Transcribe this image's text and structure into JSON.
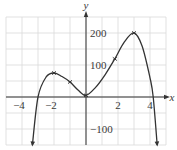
{
  "chart_data": {
    "type": "line",
    "title": "",
    "xlabel": "x",
    "ylabel": "y",
    "xlim": [
      -5,
      5
    ],
    "ylim": [
      -150,
      250
    ],
    "grid": true,
    "x_ticks": [
      -4,
      -2,
      2,
      4
    ],
    "x_tick_labels": [
      "−4",
      "−2",
      "2",
      "4"
    ],
    "y_ticks": [
      200,
      100,
      -100
    ],
    "y_tick_labels": [
      "200",
      "100",
      "−100"
    ],
    "series": [
      {
        "name": "polynomial curve",
        "x": [
          -3.35,
          -3.0,
          -2.5,
          -2.0,
          -1.5,
          -1.0,
          -0.5,
          0.0,
          0.6,
          1.2,
          1.8,
          2.4,
          3.0,
          3.5,
          4.0,
          4.2,
          4.45
        ],
        "values": [
          -150,
          0,
          62,
          75,
          64,
          47,
          22,
          5,
          30,
          70,
          119,
          172,
          200,
          160,
          60,
          0,
          -150
        ]
      }
    ],
    "marked_points": [
      {
        "x": -2,
        "y": 75
      },
      {
        "x": -1,
        "y": 47
      },
      {
        "x": 0,
        "y": 5
      },
      {
        "x": 1.8,
        "y": 119
      },
      {
        "x": 3,
        "y": 200
      }
    ],
    "end_arrows": [
      "left-down",
      "right-down"
    ],
    "colors": {
      "curve": "#333333",
      "axes": "#333333",
      "grid": "#d9d9d9"
    }
  }
}
